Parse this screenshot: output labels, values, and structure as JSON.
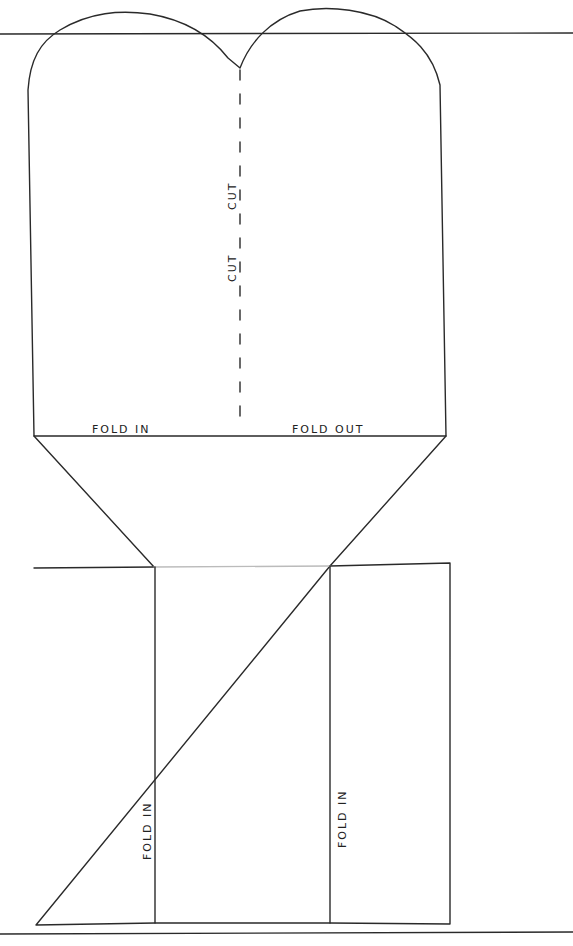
{
  "template": {
    "ink_color": "#2a2a2a",
    "labels": {
      "cut_left": "CUT",
      "cut_right": "CUT",
      "fold_in_top": "FOLD IN",
      "fold_out_top": "FOLD OUT",
      "fold_in_left_panel": "FOLD IN",
      "fold_in_right_panel": "FOLD IN"
    }
  }
}
